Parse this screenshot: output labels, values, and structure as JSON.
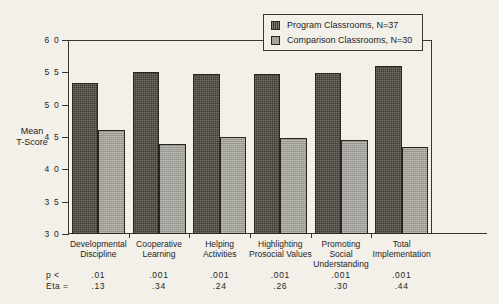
{
  "chart_data": {
    "type": "bar",
    "title": "",
    "xlabel": "",
    "ylabel": "Mean T-Score",
    "ylim": [
      30,
      60
    ],
    "yticks": [
      60,
      55,
      50,
      45,
      40,
      35,
      30
    ],
    "grid": true,
    "legend_position": "top-right",
    "categories": [
      "Developmental Discipline",
      "Cooperative Learning",
      "Helping Activities",
      "Highlighting Prosocial Values",
      "Promoting Social Understanding",
      "Total Implementation"
    ],
    "series": [
      {
        "name": "Program Classrooms, N=37",
        "color": "#3d3830",
        "values": [
          53.3,
          55.1,
          54.7,
          54.7,
          54.9,
          56.0
        ]
      },
      {
        "name": "Comparison Classrooms, N=30",
        "color": "#9d9d94",
        "values": [
          46.1,
          43.9,
          45.0,
          44.9,
          44.6,
          43.4
        ]
      }
    ],
    "annotations": {
      "p_label": "p <",
      "eta_label": "Eta  =",
      "p_values": [
        ".01",
        ".001",
        ".001",
        ".001",
        ".001",
        ".001"
      ],
      "eta_values": [
        ".13",
        ".34",
        ".24",
        ".26",
        ".30",
        ".44"
      ]
    }
  },
  "axis": {
    "y_title_line1": "Mean",
    "y_title_line2": "T-Score",
    "tick_labels": [
      "6 0",
      "5 5",
      "5 0",
      "4 5",
      "4 0",
      "3 5",
      "3 0"
    ]
  },
  "legend": {
    "items": [
      {
        "label": "Program Classrooms, N=37",
        "swatch": "dark"
      },
      {
        "label": "Comparison Classrooms, N=30",
        "swatch": "light"
      }
    ]
  },
  "categories_display": [
    {
      "line1": "Developmental",
      "line2": "Discipline",
      "line3": ""
    },
    {
      "line1": "Cooperative",
      "line2": "Learning",
      "line3": ""
    },
    {
      "line1": "Helping",
      "line2": "Activities",
      "line3": ""
    },
    {
      "line1": "Highlighting",
      "line2": "Prosocial Values",
      "line3": ""
    },
    {
      "line1": "Promoting",
      "line2": "Social",
      "line3": "Understanding"
    },
    {
      "line1": "Total",
      "line2": "Implementation",
      "line3": ""
    }
  ]
}
